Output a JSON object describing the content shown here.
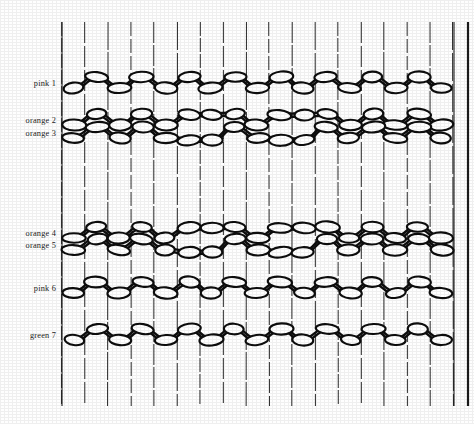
{
  "figure": {
    "kind": "beadwork-loom-weaving-diagram",
    "background_color": "#fefefe",
    "ink_color": "#0d0d0d",
    "warp_color": "#2b2b2b",
    "bead_fill": "#ffffff",
    "warp": {
      "count": 18,
      "first_x": 62,
      "spacing": 23,
      "top_y": 22,
      "bottom_y": 406
    },
    "frame": {
      "left_x": 62,
      "right_x": 454,
      "outer_right_x": 468,
      "top_y": 22,
      "bottom_y": 406
    },
    "rows": [
      {
        "id": "r1",
        "label": "pink 1",
        "color_name": "pink",
        "number": 1,
        "y": 84,
        "label_y": 84,
        "style": "zigzag-chain"
      },
      {
        "id": "r2",
        "label": "orange 2",
        "color_name": "orange",
        "number": 2,
        "y": 121,
        "label_y": 121,
        "style": "diamond-band-upper"
      },
      {
        "id": "r3",
        "label": "orange 3",
        "color_name": "orange",
        "number": 3,
        "y": 134,
        "label_y": 134,
        "style": "diamond-band-lower"
      },
      {
        "id": "r4",
        "label": "orange 4",
        "color_name": "orange",
        "number": 4,
        "y": 234,
        "label_y": 234,
        "style": "diamond-band-upper"
      },
      {
        "id": "r5",
        "label": "orange 5",
        "color_name": "orange",
        "number": 5,
        "y": 246,
        "label_y": 246,
        "style": "diamond-band-lower"
      },
      {
        "id": "r6",
        "label": "pink 6",
        "color_name": "pink",
        "number": 6,
        "y": 289,
        "label_y": 289,
        "style": "zigzag-chain"
      },
      {
        "id": "r7",
        "label": "green 7",
        "color_name": "green",
        "number": 7,
        "y": 336,
        "label_y": 336,
        "style": "zigzag-chain"
      }
    ],
    "bead": {
      "rx": 11,
      "ry": 5.2,
      "offset_up": -7,
      "offset_down": 4
    },
    "motif": {
      "peak_offset_up": -26,
      "peak_offset_down": 26,
      "diamond_centers_x": [
        200,
        292
      ],
      "note": "two lozenge/diamond motifs per orange band"
    },
    "chart_data": {
      "type": "table",
      "title": "",
      "xlabel": "warp thread (weft column)",
      "ylabel": "weft row",
      "categories": [
        "pink 1",
        "orange 2",
        "orange 3",
        "orange 4",
        "orange 5",
        "pink 6",
        "green 7"
      ],
      "series": [
        {
          "name": "beads per row",
          "values": [
            17,
            17,
            17,
            17,
            17,
            17,
            17
          ]
        }
      ],
      "grid": true,
      "legend": "none"
    }
  }
}
